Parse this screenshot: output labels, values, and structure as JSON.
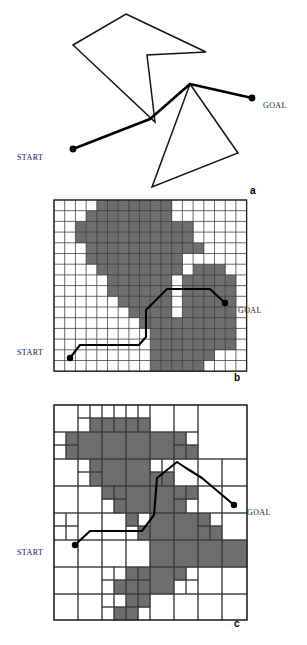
{
  "figure": {
    "caption_style": "three-panel path planning figure",
    "width": 307,
    "height": 645,
    "background": "#ffffff",
    "obstacle_fill": "#6e6e6e",
    "grid_line_color": "#3a3a3a",
    "path_color": "#000000"
  },
  "labels": {
    "start": "START",
    "goal": "GOAL",
    "panel_a": "a",
    "panel_b": "b",
    "panel_c": "c"
  },
  "panel_a": {
    "name": "continuous-polygonal-world",
    "polygons": [
      {
        "name": "upper-concave-polygon",
        "points": "126,14 206,52 147,55 155,122 73,45"
      },
      {
        "name": "lower-triangle-polygon",
        "points": "190,84 238,153 152,187"
      }
    ],
    "path": {
      "name": "solution-path",
      "points": "73,149 150,119 190,84 252,98"
    },
    "start_dot": {
      "cx": 73,
      "cy": 149,
      "r": 3.4
    },
    "goal_dot": {
      "cx": 252,
      "cy": 98,
      "r": 3.4
    },
    "start_label_pos": {
      "x": 17,
      "y": 153
    },
    "goal_label_pos": {
      "x": 263,
      "y": 101
    },
    "letter_pos": {
      "x": 250,
      "y": 185
    }
  },
  "panel_b": {
    "name": "uniform-grid-decomposition",
    "grid": {
      "x": 54,
      "y": 200,
      "cols": 18,
      "rows": 16,
      "cell": 10.7
    },
    "occupied_cells": [
      [
        4,
        0
      ],
      [
        5,
        0
      ],
      [
        6,
        0
      ],
      [
        7,
        0
      ],
      [
        8,
        0
      ],
      [
        9,
        0
      ],
      [
        10,
        0
      ],
      [
        3,
        1
      ],
      [
        4,
        1
      ],
      [
        5,
        1
      ],
      [
        6,
        1
      ],
      [
        7,
        1
      ],
      [
        8,
        1
      ],
      [
        9,
        1
      ],
      [
        10,
        1
      ],
      [
        2,
        2
      ],
      [
        3,
        2
      ],
      [
        4,
        2
      ],
      [
        5,
        2
      ],
      [
        6,
        2
      ],
      [
        7,
        2
      ],
      [
        8,
        2
      ],
      [
        9,
        2
      ],
      [
        10,
        2
      ],
      [
        11,
        2
      ],
      [
        12,
        2
      ],
      [
        2,
        3
      ],
      [
        3,
        3
      ],
      [
        4,
        3
      ],
      [
        5,
        3
      ],
      [
        6,
        3
      ],
      [
        7,
        3
      ],
      [
        8,
        3
      ],
      [
        9,
        3
      ],
      [
        10,
        3
      ],
      [
        11,
        3
      ],
      [
        12,
        3
      ],
      [
        3,
        4
      ],
      [
        4,
        4
      ],
      [
        5,
        4
      ],
      [
        6,
        4
      ],
      [
        7,
        4
      ],
      [
        8,
        4
      ],
      [
        9,
        4
      ],
      [
        10,
        4
      ],
      [
        11,
        4
      ],
      [
        12,
        4
      ],
      [
        13,
        4
      ],
      [
        3,
        5
      ],
      [
        4,
        5
      ],
      [
        5,
        5
      ],
      [
        6,
        5
      ],
      [
        7,
        5
      ],
      [
        8,
        5
      ],
      [
        9,
        5
      ],
      [
        10,
        5
      ],
      [
        11,
        5
      ],
      [
        4,
        6
      ],
      [
        5,
        6
      ],
      [
        6,
        6
      ],
      [
        7,
        6
      ],
      [
        8,
        6
      ],
      [
        9,
        6
      ],
      [
        10,
        6
      ],
      [
        11,
        6
      ],
      [
        13,
        6
      ],
      [
        14,
        6
      ],
      [
        15,
        6
      ],
      [
        5,
        7
      ],
      [
        6,
        7
      ],
      [
        7,
        7
      ],
      [
        8,
        7
      ],
      [
        9,
        7
      ],
      [
        10,
        7
      ],
      [
        12,
        7
      ],
      [
        13,
        7
      ],
      [
        14,
        7
      ],
      [
        15,
        7
      ],
      [
        16,
        7
      ],
      [
        5,
        8
      ],
      [
        6,
        8
      ],
      [
        7,
        8
      ],
      [
        8,
        8
      ],
      [
        9,
        8
      ],
      [
        10,
        8
      ],
      [
        12,
        8
      ],
      [
        13,
        8
      ],
      [
        14,
        8
      ],
      [
        15,
        8
      ],
      [
        16,
        8
      ],
      [
        6,
        9
      ],
      [
        7,
        9
      ],
      [
        8,
        9
      ],
      [
        9,
        9
      ],
      [
        10,
        9
      ],
      [
        12,
        9
      ],
      [
        13,
        9
      ],
      [
        14,
        9
      ],
      [
        15,
        9
      ],
      [
        16,
        9
      ],
      [
        7,
        10
      ],
      [
        8,
        10
      ],
      [
        9,
        10
      ],
      [
        10,
        10
      ],
      [
        12,
        10
      ],
      [
        13,
        10
      ],
      [
        14,
        10
      ],
      [
        15,
        10
      ],
      [
        16,
        10
      ],
      [
        8,
        11
      ],
      [
        9,
        11
      ],
      [
        10,
        11
      ],
      [
        11,
        11
      ],
      [
        12,
        11
      ],
      [
        13,
        11
      ],
      [
        14,
        11
      ],
      [
        15,
        11
      ],
      [
        16,
        11
      ],
      [
        9,
        12
      ],
      [
        10,
        12
      ],
      [
        11,
        12
      ],
      [
        12,
        12
      ],
      [
        13,
        12
      ],
      [
        14,
        12
      ],
      [
        15,
        12
      ],
      [
        16,
        12
      ],
      [
        9,
        13
      ],
      [
        10,
        13
      ],
      [
        11,
        13
      ],
      [
        12,
        13
      ],
      [
        13,
        13
      ],
      [
        14,
        13
      ],
      [
        15,
        13
      ],
      [
        16,
        13
      ],
      [
        9,
        14
      ],
      [
        10,
        14
      ],
      [
        11,
        14
      ],
      [
        12,
        14
      ],
      [
        13,
        14
      ],
      [
        14,
        14
      ],
      [
        9,
        15
      ],
      [
        10,
        15
      ],
      [
        11,
        15
      ],
      [
        12,
        15
      ],
      [
        13,
        15
      ]
    ],
    "path": {
      "name": "solution-path",
      "points": "70,358 80,345 139,345 146,337 146,310 167,289 210,289 225,303"
    },
    "start_dot": {
      "cx": 70,
      "cy": 358,
      "r": 3.2
    },
    "goal_dot": {
      "cx": 225,
      "cy": 303,
      "r": 3.2
    },
    "start_label_pos": {
      "x": 17,
      "y": 348
    },
    "goal_label_pos": {
      "x": 238,
      "y": 306
    },
    "letter_pos": {
      "x": 234,
      "y": 372
    }
  },
  "panel_c": {
    "name": "quadtree-decomposition",
    "grid": {
      "x": 54,
      "y": 405,
      "w": 193,
      "h": 215
    },
    "quad_cells": [
      {
        "x": 0,
        "y": 0,
        "w": 24,
        "h": 27,
        "f": 0
      },
      {
        "x": 24,
        "y": 0,
        "w": 12,
        "h": 13,
        "f": 0
      },
      {
        "x": 36,
        "y": 0,
        "w": 12,
        "h": 13,
        "f": 0
      },
      {
        "x": 24,
        "y": 13,
        "w": 12,
        "h": 14,
        "f": 0
      },
      {
        "x": 36,
        "y": 13,
        "w": 12,
        "h": 14,
        "f": 1
      },
      {
        "x": 48,
        "y": 0,
        "w": 12,
        "h": 13,
        "f": 0
      },
      {
        "x": 60,
        "y": 0,
        "w": 12,
        "h": 13,
        "f": 0
      },
      {
        "x": 48,
        "y": 13,
        "w": 12,
        "h": 14,
        "f": 1
      },
      {
        "x": 60,
        "y": 13,
        "w": 12,
        "h": 14,
        "f": 1
      },
      {
        "x": 72,
        "y": 0,
        "w": 12,
        "h": 13,
        "f": 0
      },
      {
        "x": 84,
        "y": 0,
        "w": 12,
        "h": 13,
        "f": 0
      },
      {
        "x": 72,
        "y": 13,
        "w": 12,
        "h": 14,
        "f": 1
      },
      {
        "x": 84,
        "y": 13,
        "w": 12,
        "h": 14,
        "f": 1
      },
      {
        "x": 96,
        "y": 0,
        "w": 24,
        "h": 27,
        "f": 0
      },
      {
        "x": 120,
        "y": 0,
        "w": 24,
        "h": 27,
        "f": 0
      },
      {
        "x": 144,
        "y": 0,
        "w": 49,
        "h": 54,
        "f": 0
      },
      {
        "x": 0,
        "y": 27,
        "w": 12,
        "h": 13,
        "f": 0
      },
      {
        "x": 12,
        "y": 27,
        "w": 12,
        "h": 13,
        "f": 1
      },
      {
        "x": 0,
        "y": 40,
        "w": 12,
        "h": 14,
        "f": 0
      },
      {
        "x": 12,
        "y": 40,
        "w": 12,
        "h": 14,
        "f": 1
      },
      {
        "x": 24,
        "y": 27,
        "w": 24,
        "h": 27,
        "f": 1
      },
      {
        "x": 48,
        "y": 27,
        "w": 24,
        "h": 27,
        "f": 1
      },
      {
        "x": 72,
        "y": 27,
        "w": 24,
        "h": 27,
        "f": 1
      },
      {
        "x": 96,
        "y": 27,
        "w": 24,
        "h": 27,
        "f": 1
      },
      {
        "x": 120,
        "y": 27,
        "w": 12,
        "h": 13,
        "f": 1
      },
      {
        "x": 132,
        "y": 27,
        "w": 12,
        "h": 13,
        "f": 0
      },
      {
        "x": 120,
        "y": 40,
        "w": 12,
        "h": 14,
        "f": 1
      },
      {
        "x": 132,
        "y": 40,
        "w": 12,
        "h": 14,
        "f": 1
      },
      {
        "x": 0,
        "y": 54,
        "w": 24,
        "h": 27,
        "f": 0
      },
      {
        "x": 24,
        "y": 54,
        "w": 12,
        "h": 13,
        "f": 0
      },
      {
        "x": 36,
        "y": 54,
        "w": 12,
        "h": 13,
        "f": 1
      },
      {
        "x": 24,
        "y": 67,
        "w": 12,
        "h": 14,
        "f": 0
      },
      {
        "x": 36,
        "y": 67,
        "w": 12,
        "h": 14,
        "f": 1
      },
      {
        "x": 48,
        "y": 54,
        "w": 24,
        "h": 27,
        "f": 1
      },
      {
        "x": 72,
        "y": 54,
        "w": 24,
        "h": 27,
        "f": 1
      },
      {
        "x": 96,
        "y": 54,
        "w": 12,
        "h": 13,
        "f": 0
      },
      {
        "x": 108,
        "y": 54,
        "w": 12,
        "h": 13,
        "f": 0
      },
      {
        "x": 96,
        "y": 67,
        "w": 12,
        "h": 14,
        "f": 1
      },
      {
        "x": 108,
        "y": 67,
        "w": 12,
        "h": 14,
        "f": 1
      },
      {
        "x": 120,
        "y": 54,
        "w": 24,
        "h": 27,
        "f": 0
      },
      {
        "x": 144,
        "y": 54,
        "w": 24,
        "h": 27,
        "f": 0
      },
      {
        "x": 168,
        "y": 54,
        "w": 25,
        "h": 27,
        "f": 0
      },
      {
        "x": 0,
        "y": 81,
        "w": 24,
        "h": 27,
        "f": 0
      },
      {
        "x": 24,
        "y": 81,
        "w": 24,
        "h": 27,
        "f": 0
      },
      {
        "x": 48,
        "y": 81,
        "w": 12,
        "h": 13,
        "f": 1
      },
      {
        "x": 60,
        "y": 81,
        "w": 12,
        "h": 13,
        "f": 1
      },
      {
        "x": 48,
        "y": 94,
        "w": 12,
        "h": 14,
        "f": 0
      },
      {
        "x": 60,
        "y": 94,
        "w": 12,
        "h": 14,
        "f": 1
      },
      {
        "x": 72,
        "y": 81,
        "w": 24,
        "h": 27,
        "f": 1
      },
      {
        "x": 96,
        "y": 81,
        "w": 24,
        "h": 27,
        "f": 1
      },
      {
        "x": 120,
        "y": 81,
        "w": 12,
        "h": 13,
        "f": 1
      },
      {
        "x": 132,
        "y": 81,
        "w": 12,
        "h": 13,
        "f": 1
      },
      {
        "x": 120,
        "y": 94,
        "w": 12,
        "h": 14,
        "f": 1
      },
      {
        "x": 132,
        "y": 94,
        "w": 12,
        "h": 14,
        "f": 0
      },
      {
        "x": 144,
        "y": 81,
        "w": 24,
        "h": 27,
        "f": 0
      },
      {
        "x": 168,
        "y": 81,
        "w": 25,
        "h": 27,
        "f": 0
      },
      {
        "x": 0,
        "y": 108,
        "w": 12,
        "h": 13,
        "f": 0
      },
      {
        "x": 12,
        "y": 108,
        "w": 12,
        "h": 13,
        "f": 0
      },
      {
        "x": 0,
        "y": 121,
        "w": 12,
        "h": 14,
        "f": 0
      },
      {
        "x": 12,
        "y": 121,
        "w": 12,
        "h": 14,
        "f": 0
      },
      {
        "x": 24,
        "y": 108,
        "w": 24,
        "h": 27,
        "f": 0
      },
      {
        "x": 48,
        "y": 108,
        "w": 24,
        "h": 27,
        "f": 0
      },
      {
        "x": 72,
        "y": 108,
        "w": 12,
        "h": 13,
        "f": 1
      },
      {
        "x": 84,
        "y": 108,
        "w": 12,
        "h": 13,
        "f": 0
      },
      {
        "x": 72,
        "y": 121,
        "w": 12,
        "h": 14,
        "f": 0
      },
      {
        "x": 84,
        "y": 121,
        "w": 12,
        "h": 14,
        "f": 1
      },
      {
        "x": 96,
        "y": 108,
        "w": 24,
        "h": 27,
        "f": 1
      },
      {
        "x": 120,
        "y": 108,
        "w": 24,
        "h": 27,
        "f": 1
      },
      {
        "x": 144,
        "y": 108,
        "w": 12,
        "h": 13,
        "f": 1
      },
      {
        "x": 156,
        "y": 108,
        "w": 12,
        "h": 13,
        "f": 0
      },
      {
        "x": 144,
        "y": 121,
        "w": 12,
        "h": 14,
        "f": 1
      },
      {
        "x": 156,
        "y": 121,
        "w": 12,
        "h": 14,
        "f": 1
      },
      {
        "x": 168,
        "y": 108,
        "w": 25,
        "h": 27,
        "f": 0
      },
      {
        "x": 0,
        "y": 135,
        "w": 24,
        "h": 27,
        "f": 0
      },
      {
        "x": 24,
        "y": 135,
        "w": 24,
        "h": 27,
        "f": 0
      },
      {
        "x": 48,
        "y": 135,
        "w": 24,
        "h": 27,
        "f": 0
      },
      {
        "x": 72,
        "y": 135,
        "w": 24,
        "h": 27,
        "f": 0
      },
      {
        "x": 96,
        "y": 135,
        "w": 24,
        "h": 27,
        "f": 1
      },
      {
        "x": 120,
        "y": 135,
        "w": 24,
        "h": 27,
        "f": 1
      },
      {
        "x": 144,
        "y": 135,
        "w": 24,
        "h": 27,
        "f": 1
      },
      {
        "x": 168,
        "y": 135,
        "w": 25,
        "h": 27,
        "f": 1
      },
      {
        "x": 0,
        "y": 162,
        "w": 24,
        "h": 27,
        "f": 0
      },
      {
        "x": 24,
        "y": 162,
        "w": 24,
        "h": 27,
        "f": 0
      },
      {
        "x": 48,
        "y": 162,
        "w": 12,
        "h": 13,
        "f": 0
      },
      {
        "x": 60,
        "y": 162,
        "w": 12,
        "h": 13,
        "f": 0
      },
      {
        "x": 48,
        "y": 175,
        "w": 12,
        "h": 14,
        "f": 0
      },
      {
        "x": 60,
        "y": 175,
        "w": 12,
        "h": 14,
        "f": 1
      },
      {
        "x": 72,
        "y": 162,
        "w": 12,
        "h": 13,
        "f": 1
      },
      {
        "x": 84,
        "y": 162,
        "w": 12,
        "h": 13,
        "f": 1
      },
      {
        "x": 72,
        "y": 175,
        "w": 12,
        "h": 14,
        "f": 1
      },
      {
        "x": 84,
        "y": 175,
        "w": 12,
        "h": 14,
        "f": 1
      },
      {
        "x": 96,
        "y": 162,
        "w": 24,
        "h": 27,
        "f": 1
      },
      {
        "x": 120,
        "y": 162,
        "w": 12,
        "h": 13,
        "f": 1
      },
      {
        "x": 132,
        "y": 162,
        "w": 12,
        "h": 13,
        "f": 0
      },
      {
        "x": 120,
        "y": 175,
        "w": 12,
        "h": 14,
        "f": 0
      },
      {
        "x": 132,
        "y": 175,
        "w": 12,
        "h": 14,
        "f": 0
      },
      {
        "x": 144,
        "y": 162,
        "w": 24,
        "h": 27,
        "f": 0
      },
      {
        "x": 168,
        "y": 162,
        "w": 25,
        "h": 27,
        "f": 0
      },
      {
        "x": 0,
        "y": 189,
        "w": 24,
        "h": 26,
        "f": 0
      },
      {
        "x": 24,
        "y": 189,
        "w": 24,
        "h": 26,
        "f": 0
      },
      {
        "x": 48,
        "y": 189,
        "w": 12,
        "h": 13,
        "f": 0
      },
      {
        "x": 60,
        "y": 189,
        "w": 12,
        "h": 13,
        "f": 0
      },
      {
        "x": 48,
        "y": 202,
        "w": 12,
        "h": 13,
        "f": 0
      },
      {
        "x": 60,
        "y": 202,
        "w": 12,
        "h": 13,
        "f": 1
      },
      {
        "x": 72,
        "y": 189,
        "w": 12,
        "h": 13,
        "f": 1
      },
      {
        "x": 84,
        "y": 189,
        "w": 12,
        "h": 13,
        "f": 1
      },
      {
        "x": 72,
        "y": 202,
        "w": 12,
        "h": 13,
        "f": 1
      },
      {
        "x": 84,
        "y": 202,
        "w": 12,
        "h": 13,
        "f": 0
      },
      {
        "x": 96,
        "y": 189,
        "w": 24,
        "h": 26,
        "f": 0
      },
      {
        "x": 120,
        "y": 189,
        "w": 24,
        "h": 26,
        "f": 0
      },
      {
        "x": 144,
        "y": 189,
        "w": 24,
        "h": 26,
        "f": 0
      },
      {
        "x": 168,
        "y": 189,
        "w": 25,
        "h": 26,
        "f": 0
      }
    ],
    "path": {
      "name": "solution-path",
      "points": "75,545 90,531 142,531 154,515 157,478 177,462 186,468 202,478 234,505"
    },
    "start_dot": {
      "cx": 75,
      "cy": 545,
      "r": 3.2
    },
    "goal_dot": {
      "cx": 234,
      "cy": 505,
      "r": 3.2
    },
    "start_label_pos": {
      "x": 17,
      "y": 548
    },
    "goal_label_pos": {
      "x": 247,
      "y": 508
    },
    "letter_pos": {
      "x": 234,
      "y": 618
    }
  }
}
